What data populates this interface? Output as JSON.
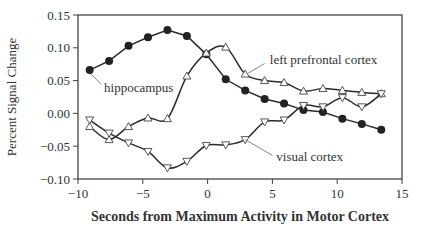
{
  "chart_data": {
    "type": "line",
    "title": "",
    "xlabel": "Seconds from Maximum Activity in Motor Cortex",
    "ylabel": "Percent Signal Change",
    "xlim": [
      -10,
      15
    ],
    "ylim": [
      -0.1,
      0.15
    ],
    "xticks": [
      "−10",
      "−5",
      "0",
      "5",
      "10",
      "15"
    ],
    "xtick_values": [
      -10,
      -5,
      0,
      5,
      10,
      15
    ],
    "yticks": [
      "0.15",
      "0.10",
      "0.05",
      "0.00",
      "−0.05",
      "−0.10"
    ],
    "ytick_values": [
      0.15,
      0.1,
      0.05,
      0.0,
      -0.05,
      -0.1
    ],
    "grid": false,
    "legend": "inline annotations",
    "x": [
      -9.1,
      -7.6,
      -6.1,
      -4.6,
      -3.1,
      -1.6,
      -0.1,
      1.4,
      2.9,
      4.4,
      5.9,
      7.4,
      8.9,
      10.4,
      11.9,
      13.4
    ],
    "series": [
      {
        "name": "hippocampus",
        "marker": "filled-circle",
        "values": [
          0.066,
          0.08,
          0.103,
          0.116,
          0.127,
          0.118,
          0.09,
          0.052,
          0.035,
          0.022,
          0.015,
          0.005,
          0.002,
          -0.008,
          -0.016,
          -0.025
        ]
      },
      {
        "name": "left prefrontal cortex",
        "marker": "up-triangle",
        "values": [
          -0.02,
          -0.04,
          -0.02,
          -0.007,
          -0.008,
          0.057,
          0.092,
          0.101,
          0.06,
          0.05,
          0.047,
          0.034,
          0.038,
          0.035,
          0.032,
          0.03
        ]
      },
      {
        "name": "visual cortex",
        "marker": "down-triangle",
        "values": [
          -0.01,
          -0.03,
          -0.045,
          -0.058,
          -0.083,
          -0.073,
          -0.049,
          -0.048,
          -0.04,
          -0.013,
          -0.01,
          0.012,
          0.01,
          0.024,
          0.01,
          0.03
        ]
      }
    ],
    "annotations": [
      {
        "text": "hippocampus",
        "x": -7.6,
        "y": 0.033
      },
      {
        "text": "left prefrontal cortex",
        "x": 4.8,
        "y": 0.075
      },
      {
        "text": "visual cortex",
        "x": 5.3,
        "y": -0.073
      }
    ]
  },
  "colors": {
    "line": "#2b2b2b",
    "text": "#333333",
    "axis": "#444444",
    "leader": "#777777"
  }
}
